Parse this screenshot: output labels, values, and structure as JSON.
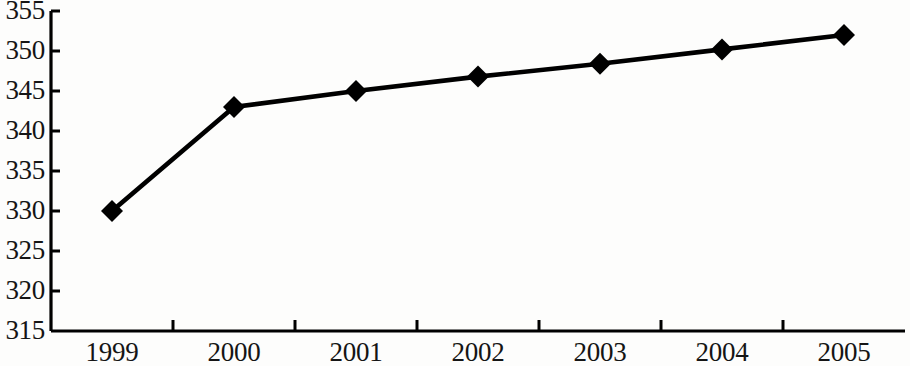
{
  "chart_data": {
    "type": "line",
    "title": "",
    "subtitle": "",
    "xlabel": "",
    "ylabel": "",
    "categories": [
      "1999",
      "2000",
      "2001",
      "2002",
      "2003",
      "2004",
      "2005"
    ],
    "values": [
      330,
      343,
      345,
      346.8,
      348.4,
      350.2,
      352
    ],
    "series": [
      {
        "name": "",
        "values": [
          330,
          343,
          345,
          346.8,
          348.4,
          350.2,
          352
        ]
      }
    ],
    "ylim": [
      315,
      355
    ],
    "y_ticks": [
      315,
      320,
      325,
      330,
      335,
      340,
      345,
      350,
      355
    ],
    "y_tick_labels": [
      "315",
      "320",
      "325",
      "330",
      "335",
      "340",
      "345",
      "350",
      "355"
    ],
    "x_tick_labels": [
      "1999",
      "2000",
      "2001",
      "2002",
      "2003",
      "2004",
      "2005"
    ],
    "grid": false,
    "legend": "none",
    "marker": "diamond",
    "line_color": "#000000",
    "marker_color": "#000000",
    "axis_color": "#000000",
    "background_color": "#fdfdfc"
  }
}
